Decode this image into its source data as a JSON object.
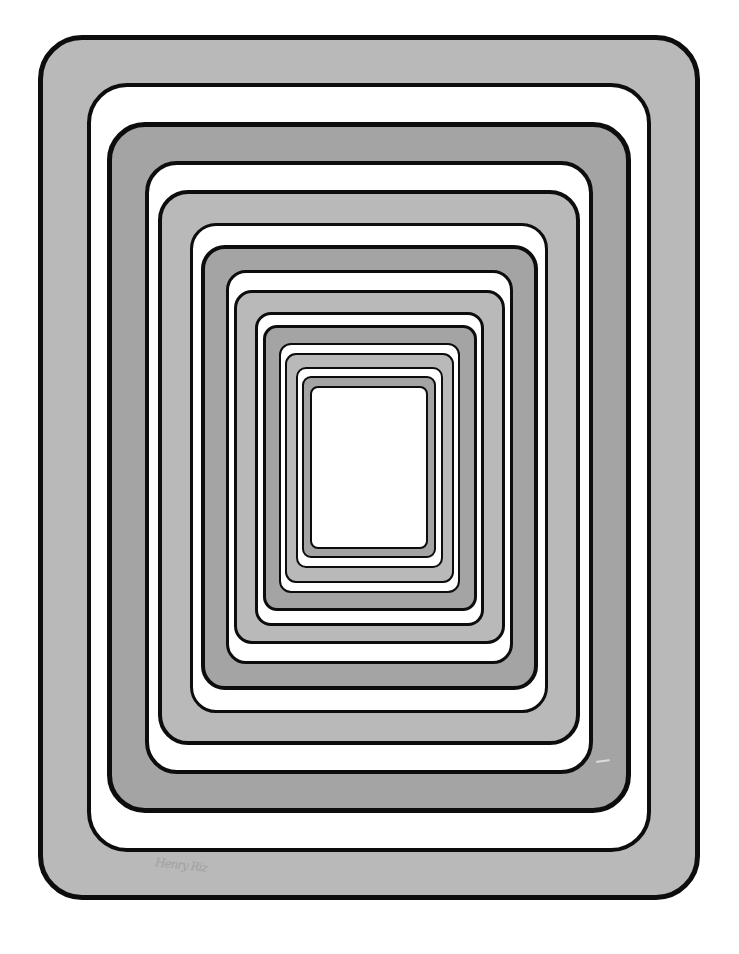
{
  "artwork": {
    "title": "Nested rounded rectangles (op-art tunnel)",
    "colors": {
      "outline": "#0d0d0d",
      "light_gray": "#b9b9b9",
      "dark_gray": "#a4a4a4",
      "white": "#ffffff"
    },
    "rings": [
      {
        "left": 38,
        "top": 35,
        "right": 700,
        "bottom": 900,
        "fill": "light_gray",
        "border": 5,
        "radius": 44
      },
      {
        "left": 87,
        "top": 83,
        "right": 651,
        "bottom": 852,
        "fill": "white",
        "border": 4,
        "radius": 40
      },
      {
        "left": 107,
        "top": 122,
        "right": 631,
        "bottom": 813,
        "fill": "dark_gray",
        "border": 5,
        "radius": 38
      },
      {
        "left": 145,
        "top": 161,
        "right": 593,
        "bottom": 774,
        "fill": "white",
        "border": 4,
        "radius": 32
      },
      {
        "left": 158,
        "top": 190,
        "right": 580,
        "bottom": 745,
        "fill": "light_gray",
        "border": 4,
        "radius": 30
      },
      {
        "left": 190,
        "top": 223,
        "right": 548,
        "bottom": 713,
        "fill": "white",
        "border": 3,
        "radius": 26
      },
      {
        "left": 201,
        "top": 245,
        "right": 538,
        "bottom": 690,
        "fill": "dark_gray",
        "border": 4,
        "radius": 24
      },
      {
        "left": 226,
        "top": 270,
        "right": 513,
        "bottom": 664,
        "fill": "white",
        "border": 3,
        "radius": 20
      },
      {
        "left": 234,
        "top": 290,
        "right": 505,
        "bottom": 644,
        "fill": "light_gray",
        "border": 3,
        "radius": 18
      },
      {
        "left": 255,
        "top": 312,
        "right": 484,
        "bottom": 626,
        "fill": "white",
        "border": 3,
        "radius": 16
      },
      {
        "left": 263,
        "top": 325,
        "right": 477,
        "bottom": 611,
        "fill": "dark_gray",
        "border": 3,
        "radius": 14
      },
      {
        "left": 279,
        "top": 343,
        "right": 460,
        "bottom": 593,
        "fill": "white",
        "border": 2,
        "radius": 12
      },
      {
        "left": 285,
        "top": 353,
        "right": 454,
        "bottom": 583,
        "fill": "light_gray",
        "border": 2,
        "radius": 11
      },
      {
        "left": 296,
        "top": 367,
        "right": 443,
        "bottom": 568,
        "fill": "white",
        "border": 2,
        "radius": 10
      },
      {
        "left": 302,
        "top": 376,
        "right": 436,
        "bottom": 558,
        "fill": "dark_gray",
        "border": 2,
        "radius": 9
      },
      {
        "left": 310,
        "top": 386,
        "right": 428,
        "bottom": 549,
        "fill": "white",
        "border": 2,
        "radius": 8
      }
    ],
    "signature": "Henry Riz"
  }
}
